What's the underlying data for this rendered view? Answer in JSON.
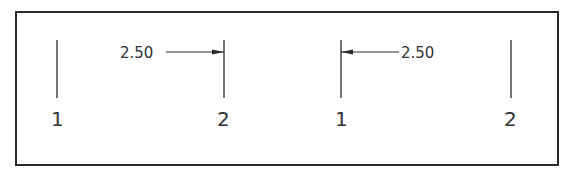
{
  "diagram": {
    "type": "dimension-leader-illustration",
    "colors": {
      "line": "#2a2a2a",
      "text": "#333333",
      "background": "#ffffff"
    },
    "left_example": {
      "dimension_text": "2.50",
      "arrow_direction": "right",
      "extension_lines": [
        {
          "label": "1"
        },
        {
          "label": "2"
        }
      ]
    },
    "right_example": {
      "dimension_text": "2.50",
      "arrow_direction": "left",
      "extension_lines": [
        {
          "label": "1"
        },
        {
          "label": "2"
        }
      ]
    }
  }
}
